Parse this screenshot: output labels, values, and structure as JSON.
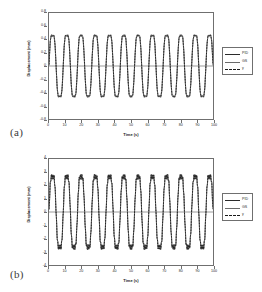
{
  "figure": {
    "panels": [
      {
        "id": "a",
        "panel_label": "(a)",
        "legend": [
          {
            "label": "PID",
            "style": "solid-dark"
          },
          {
            "label": "GS",
            "style": "solid-gray"
          },
          {
            "label": "y",
            "style": "dashed"
          }
        ],
        "chart_data": {
          "type": "line",
          "title": "",
          "xlabel": "Time (s)",
          "ylabel": "Displacement (mm)",
          "xlim": [
            0,
            100
          ],
          "ylim": [
            -0.8,
            0.8
          ],
          "xticks": [
            "0",
            "10",
            "20",
            "30",
            "40",
            "50",
            "60",
            "70",
            "80",
            "90",
            "100"
          ],
          "yticks": [
            "0.8",
            "0.6",
            "0.4",
            "0.2",
            "0",
            "-0.2",
            "-0.4",
            "-0.6",
            "-0.8"
          ],
          "grid": false,
          "legend_position": "outside-right",
          "period_s": 8.7,
          "amplitude_mm": 0.57,
          "series": [
            {
              "name": "PID",
              "amplitude": 0.58,
              "phase": 0.0,
              "color": "#2b2b2b",
              "dash": "none",
              "width": 0.7
            },
            {
              "name": "GS",
              "amplitude": 0.56,
              "phase": 0.04,
              "color": "#6a6a6a",
              "dash": "none",
              "width": 0.7
            },
            {
              "name": "y",
              "amplitude": 0.57,
              "phase": 0.02,
              "color": "#1a1a1a",
              "dash": "1.6,1.2",
              "width": 0.9
            }
          ]
        }
      },
      {
        "id": "b",
        "panel_label": "(b)",
        "legend": [
          {
            "label": "PID",
            "style": "solid-dark"
          },
          {
            "label": "GS",
            "style": "solid-gray"
          },
          {
            "label": "y",
            "style": "dashed"
          }
        ],
        "chart_data": {
          "type": "line",
          "title": "",
          "xlabel": "Time (s)",
          "ylabel": "Displacement (mm)",
          "xlim": [
            0,
            100
          ],
          "ylim": [
            -4,
            4
          ],
          "xticks": [
            "0",
            "10",
            "20",
            "30",
            "40",
            "50",
            "60",
            "70",
            "80",
            "90",
            "100"
          ],
          "yticks": [
            "4",
            "3",
            "2",
            "1",
            "0",
            "-1",
            "-2",
            "-3",
            "-4"
          ],
          "grid": false,
          "legend_position": "outside-right",
          "period_s": 8.7,
          "amplitude_mm": 3.3,
          "series": [
            {
              "name": "PID",
              "amplitude": 3.32,
              "phase": 0.0,
              "color": "#2b2b2b",
              "dash": "none",
              "width": 0.7
            },
            {
              "name": "GS",
              "amplitude": 3.28,
              "phase": 0.03,
              "color": "#6a6a6a",
              "dash": "none",
              "width": 0.7
            },
            {
              "name": "y",
              "amplitude": 3.3,
              "phase": 0.015,
              "color": "#1a1a1a",
              "dash": "1.6,1.2",
              "width": 0.9
            }
          ]
        }
      }
    ]
  }
}
